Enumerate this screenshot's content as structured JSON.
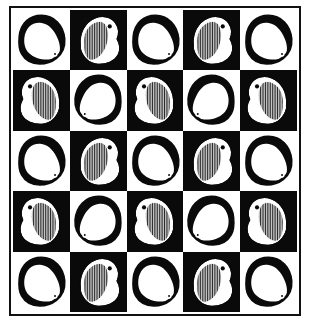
{
  "artwork": {
    "title": "Bird Checkerboard Tessellation",
    "style": "escher-style-bird-motif",
    "grid": {
      "rows": 5,
      "columns": 5,
      "cell_count": 25
    },
    "colors": {
      "black": "#0a0a0a",
      "white": "#ffffff",
      "border": "#111111",
      "page_background": "#ffffff"
    },
    "border": {
      "width_px": 2,
      "color": "#111111"
    },
    "motifs": {
      "solid": "solid-silhouette-bird",
      "striped": "striped-wing-bird"
    },
    "cells": [
      {
        "row": 1,
        "col": 1,
        "background": "white",
        "bird": "black",
        "motif": "solid",
        "facing": "right",
        "head": "lower-right",
        "name": "bird-r1c1"
      },
      {
        "row": 1,
        "col": 2,
        "background": "black",
        "bird": "white",
        "motif": "striped",
        "facing": "right",
        "head": "upper-right",
        "name": "bird-r1c2"
      },
      {
        "row": 1,
        "col": 3,
        "background": "white",
        "bird": "black",
        "motif": "solid",
        "facing": "right",
        "head": "lower-right",
        "name": "bird-r1c3"
      },
      {
        "row": 1,
        "col": 4,
        "background": "black",
        "bird": "white",
        "motif": "striped",
        "facing": "right",
        "head": "upper-right",
        "name": "bird-r1c4"
      },
      {
        "row": 1,
        "col": 5,
        "background": "white",
        "bird": "black",
        "motif": "solid",
        "facing": "right",
        "head": "lower-right",
        "name": "bird-r1c5"
      },
      {
        "row": 2,
        "col": 1,
        "background": "black",
        "bird": "white",
        "motif": "striped",
        "facing": "left",
        "head": "lower-left",
        "name": "bird-r2c1"
      },
      {
        "row": 2,
        "col": 2,
        "background": "white",
        "bird": "black",
        "motif": "solid",
        "facing": "left",
        "head": "upper-left",
        "name": "bird-r2c2"
      },
      {
        "row": 2,
        "col": 3,
        "background": "black",
        "bird": "white",
        "motif": "striped",
        "facing": "left",
        "head": "lower-left",
        "name": "bird-r2c3"
      },
      {
        "row": 2,
        "col": 4,
        "background": "white",
        "bird": "black",
        "motif": "solid",
        "facing": "left",
        "head": "upper-left",
        "name": "bird-r2c4"
      },
      {
        "row": 2,
        "col": 5,
        "background": "black",
        "bird": "white",
        "motif": "striped",
        "facing": "left",
        "head": "lower-left",
        "name": "bird-r2c5"
      },
      {
        "row": 3,
        "col": 1,
        "background": "white",
        "bird": "black",
        "motif": "solid",
        "facing": "right",
        "head": "lower-right",
        "name": "bird-r3c1"
      },
      {
        "row": 3,
        "col": 2,
        "background": "black",
        "bird": "white",
        "motif": "striped",
        "facing": "right",
        "head": "upper-right",
        "name": "bird-r3c2"
      },
      {
        "row": 3,
        "col": 3,
        "background": "white",
        "bird": "black",
        "motif": "solid",
        "facing": "right",
        "head": "lower-right",
        "name": "bird-r3c3"
      },
      {
        "row": 3,
        "col": 4,
        "background": "black",
        "bird": "white",
        "motif": "striped",
        "facing": "right",
        "head": "upper-right",
        "name": "bird-r3c4"
      },
      {
        "row": 3,
        "col": 5,
        "background": "white",
        "bird": "black",
        "motif": "solid",
        "facing": "right",
        "head": "lower-right",
        "name": "bird-r3c5"
      },
      {
        "row": 4,
        "col": 1,
        "background": "black",
        "bird": "white",
        "motif": "striped",
        "facing": "left",
        "head": "lower-left",
        "name": "bird-r4c1"
      },
      {
        "row": 4,
        "col": 2,
        "background": "white",
        "bird": "black",
        "motif": "solid",
        "facing": "left",
        "head": "upper-left",
        "name": "bird-r4c2"
      },
      {
        "row": 4,
        "col": 3,
        "background": "black",
        "bird": "white",
        "motif": "striped",
        "facing": "left",
        "head": "lower-left",
        "name": "bird-r4c3"
      },
      {
        "row": 4,
        "col": 4,
        "background": "white",
        "bird": "black",
        "motif": "solid",
        "facing": "left",
        "head": "upper-left",
        "name": "bird-r4c4"
      },
      {
        "row": 4,
        "col": 5,
        "background": "black",
        "bird": "white",
        "motif": "striped",
        "facing": "left",
        "head": "lower-left",
        "name": "bird-r4c5"
      },
      {
        "row": 5,
        "col": 1,
        "background": "white",
        "bird": "black",
        "motif": "solid",
        "facing": "right",
        "head": "lower-right",
        "name": "bird-r5c1"
      },
      {
        "row": 5,
        "col": 2,
        "background": "black",
        "bird": "white",
        "motif": "striped",
        "facing": "right",
        "head": "upper-right",
        "name": "bird-r5c2"
      },
      {
        "row": 5,
        "col": 3,
        "background": "white",
        "bird": "black",
        "motif": "solid",
        "facing": "right",
        "head": "lower-right",
        "name": "bird-r5c3"
      },
      {
        "row": 5,
        "col": 4,
        "background": "black",
        "bird": "white",
        "motif": "striped",
        "facing": "right",
        "head": "upper-right",
        "name": "bird-r5c4"
      },
      {
        "row": 5,
        "col": 5,
        "background": "white",
        "bird": "black",
        "motif": "solid",
        "facing": "right",
        "head": "lower-right",
        "name": "bird-r5c5"
      }
    ]
  }
}
